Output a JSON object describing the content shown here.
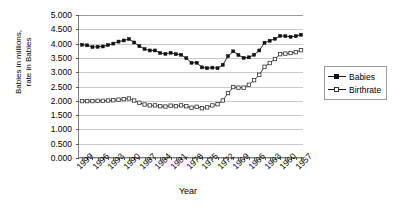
{
  "chart_data": {
    "type": "line",
    "title": "",
    "xlabel": "Year",
    "ylabel": "Babies in millions, rate in Babies",
    "ylabel_line1": "Babies in millions,",
    "ylabel_line2": "rate in Babies",
    "ylim": [
      0,
      5
    ],
    "ystep": 0.5,
    "ytick_labels": [
      "5.000",
      "4.500",
      "4.000",
      "3.500",
      "3.000",
      "2.500",
      "2.000",
      "1.500",
      "1.000",
      "0.500",
      "0.000"
    ],
    "ytick_values": [
      5,
      4.5,
      4,
      3.5,
      3,
      2.5,
      2,
      1.5,
      1,
      0.5,
      0
    ],
    "grid": true,
    "legend_position": "right",
    "x_tick_label_step": 3,
    "x": [
      1999,
      1998,
      1997,
      1996,
      1995,
      1994,
      1993,
      1992,
      1991,
      1990,
      1989,
      1988,
      1987,
      1986,
      1985,
      1984,
      1983,
      1982,
      1981,
      1980,
      1979,
      1978,
      1977,
      1976,
      1975,
      1974,
      1973,
      1972,
      1971,
      1970,
      1969,
      1968,
      1967,
      1966,
      1965,
      1964,
      1963,
      1962,
      1961,
      1960,
      1959,
      1958,
      1957
    ],
    "xtick_labels": [
      "1999",
      "1996",
      "1993",
      "1990",
      "1987",
      "1984",
      "1981",
      "1978",
      "1975",
      "1972",
      "1969",
      "1966",
      "1963",
      "1960",
      "1957"
    ],
    "series": [
      {
        "name": "Babies",
        "marker": "filled-square",
        "color": "#111111",
        "values": [
          3.96,
          3.94,
          3.88,
          3.89,
          3.9,
          3.95,
          4.0,
          4.07,
          4.11,
          4.16,
          4.04,
          3.91,
          3.81,
          3.76,
          3.76,
          3.67,
          3.64,
          3.68,
          3.63,
          3.61,
          3.49,
          3.33,
          3.33,
          3.17,
          3.14,
          3.16,
          3.14,
          3.26,
          3.56,
          3.73,
          3.6,
          3.5,
          3.52,
          3.61,
          3.76,
          4.03,
          4.1,
          4.17,
          4.27,
          4.26,
          4.24,
          4.26,
          4.31
        ]
      },
      {
        "name": "Birthrate",
        "marker": "open-square",
        "color": "#333333",
        "values": [
          1.99,
          1.99,
          1.99,
          2.0,
          2.0,
          2.01,
          2.02,
          2.04,
          2.06,
          2.08,
          2.01,
          1.93,
          1.87,
          1.84,
          1.84,
          1.81,
          1.8,
          1.83,
          1.81,
          1.84,
          1.81,
          1.76,
          1.79,
          1.74,
          1.77,
          1.84,
          1.88,
          2.01,
          2.27,
          2.48,
          2.46,
          2.46,
          2.56,
          2.72,
          2.91,
          3.19,
          3.32,
          3.46,
          3.63,
          3.65,
          3.67,
          3.7,
          3.77
        ]
      }
    ]
  },
  "legend": {
    "items": [
      {
        "label": "Babies"
      },
      {
        "label": "Birthrate"
      }
    ]
  }
}
